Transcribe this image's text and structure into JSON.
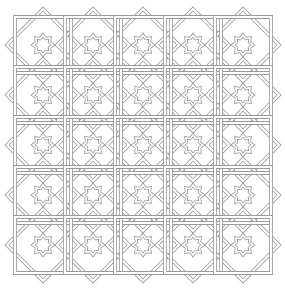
{
  "pattern": {
    "name": "interlaced 8-point star lattice",
    "rows": 5,
    "cols": 5,
    "origin": [
      18,
      20
    ],
    "tile_size": 50,
    "stroke_color": "#9a9a9a",
    "band_fill": "#ffffff",
    "background": "#ffffff"
  }
}
